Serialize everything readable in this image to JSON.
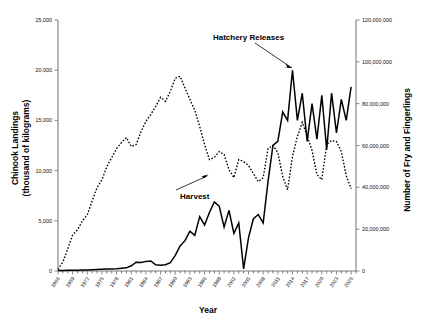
{
  "chart_data": {
    "type": "line",
    "title": "",
    "xlabel": "Year",
    "ylabel": "Chinook Landings\n(thousand of kilograms)",
    "y2label": "Number of Fry and Fingerlings",
    "grid": false,
    "legend_position": "inline-annotations",
    "xlim": [
      1966,
      2027
    ],
    "ylim": [
      0,
      25000
    ],
    "y2lim": [
      0,
      120000000
    ],
    "xticks": [
      1966,
      1969,
      1972,
      1975,
      1978,
      1981,
      1984,
      1987,
      1990,
      1993,
      1996,
      1999,
      2002,
      2005,
      2008,
      2011,
      2014,
      2017,
      2020,
      2023,
      2026
    ],
    "xtick_labels": [
      "1966",
      "1969",
      "1972",
      "1975",
      "1978",
      "1981",
      "1984",
      "1987",
      "1990",
      "1993",
      "1996",
      "1999",
      "2002",
      "2005",
      "2008",
      "2011",
      "2014",
      "2017",
      "2020",
      "2023",
      "2026"
    ],
    "yticks": [
      0,
      5000,
      10000,
      15000,
      20000,
      25000
    ],
    "ytick_labels": [
      "0",
      "5,000",
      "10,000",
      "15,000",
      "20,000",
      "25,000"
    ],
    "y2ticks": [
      0,
      20000000,
      40000000,
      60000000,
      80000000,
      100000000,
      120000000
    ],
    "y2tick_labels": [
      "0",
      "20,000,000",
      "40,000,000",
      "60,000,000",
      "80,000,000",
      "100,000,000",
      "120,000,000"
    ],
    "annotations": [
      {
        "text": "Hatchery Releases",
        "x": 2005,
        "y": 23000
      },
      {
        "text": "Harvest",
        "x": 1994,
        "y": 7200
      }
    ],
    "series": [
      {
        "name": "Harvest",
        "axis": "left",
        "style": "dashed",
        "x": [
          1966,
          1967,
          1968,
          1969,
          1970,
          1971,
          1972,
          1973,
          1974,
          1975,
          1976,
          1977,
          1978,
          1979,
          1980,
          1981,
          1982,
          1983,
          1984,
          1985,
          1986,
          1987,
          1988,
          1989,
          1990,
          1991,
          1992,
          1993,
          1994,
          1995,
          1996,
          1997,
          1998,
          1999,
          2000,
          2001,
          2002,
          2003,
          2004,
          2005,
          2006,
          2007,
          2008,
          2009,
          2010,
          2011,
          2012,
          2013,
          2014,
          2015,
          2016,
          2017,
          2018,
          2019,
          2020,
          2021,
          2022,
          2023,
          2024,
          2025,
          2026
        ],
        "values": [
          150,
          900,
          2200,
          3600,
          4100,
          5000,
          5600,
          7000,
          8300,
          9100,
          10400,
          11300,
          12200,
          12800,
          13300,
          12400,
          12600,
          13900,
          14900,
          15600,
          16400,
          17300,
          16900,
          17900,
          19200,
          19400,
          18200,
          17100,
          16000,
          14400,
          12600,
          11100,
          11300,
          11900,
          11600,
          10100,
          9300,
          11100,
          10900,
          10500,
          9700,
          8900,
          9300,
          12200,
          12500,
          11800,
          9400,
          8100,
          11400,
          13400,
          14800,
          13500,
          12000,
          9600,
          9100,
          12600,
          13000,
          12900,
          11900,
          9500,
          8200
        ]
      },
      {
        "name": "Hatchery Releases",
        "axis": "right",
        "style": "solid",
        "x": [
          1966,
          1967,
          1968,
          1969,
          1970,
          1971,
          1972,
          1973,
          1974,
          1975,
          1976,
          1977,
          1978,
          1979,
          1980,
          1981,
          1982,
          1983,
          1984,
          1985,
          1986,
          1987,
          1988,
          1989,
          1990,
          1991,
          1992,
          1993,
          1994,
          1995,
          1996,
          1997,
          1998,
          1999,
          2000,
          2001,
          2002,
          2003,
          2004,
          2005,
          2006,
          2007,
          2008,
          2009,
          2010,
          2011,
          2012,
          2013,
          2014,
          2015,
          2016,
          2017,
          2018,
          2019,
          2020,
          2021,
          2022,
          2023,
          2024,
          2025,
          2026
        ],
        "values": [
          200000,
          250000,
          300000,
          350000,
          400000,
          450000,
          500000,
          600000,
          700000,
          800000,
          900000,
          1000000,
          1100000,
          1300000,
          1500000,
          2500000,
          4200000,
          4100000,
          4600000,
          4800000,
          3000000,
          2800000,
          3000000,
          4000000,
          7500000,
          12000000,
          14500000,
          19000000,
          17000000,
          26000000,
          22000000,
          28000000,
          33000000,
          31000000,
          21000000,
          29000000,
          18000000,
          23000000,
          1000000,
          16000000,
          25000000,
          27000000,
          23000000,
          43000000,
          60000000,
          62000000,
          76000000,
          72000000,
          96000000,
          72000000,
          85000000,
          62000000,
          80000000,
          63000000,
          84000000,
          58000000,
          85000000,
          66000000,
          82000000,
          72000000,
          88000000
        ]
      }
    ]
  },
  "axes": {
    "left_title_line1": "Chinook Landings",
    "left_title_line2": "(thousand of kilograms)",
    "right_title": "Number of Fry and Fingerlings",
    "x_title": "Year"
  }
}
